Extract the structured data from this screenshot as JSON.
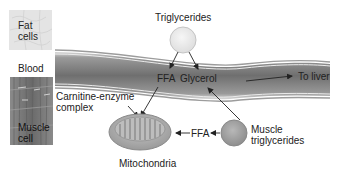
{
  "labels": {
    "fat_cells_line1": "Fat",
    "fat_cells_line2": "cells",
    "blood": "Blood",
    "muscle_cell_line1": "Muscle",
    "muscle_cell_line2": "cell",
    "triglycerides": "Triglycerides",
    "ffa_in_blood": "FFA",
    "glycerol": "Glycerol",
    "to_liver": "To liver",
    "carnitine_line1": "Carnitine-enzyme",
    "carnitine_line2": "complex",
    "mitochondria": "Mitochondria",
    "ffa_from_muscle": "FFA",
    "muscle_tg_line1": "Muscle",
    "muscle_tg_line2": "triglycerides"
  },
  "colors": {
    "vessel_dark": "#6e6e6e",
    "vessel_light": "#b5b5b5",
    "fat_cells": "#e6e6e6",
    "muscle_tissue": "#7a7a7a",
    "triglyceride_circle": "#ececec",
    "muscle_tg_circle": "#a8a8a8",
    "arrow": "#222222"
  }
}
